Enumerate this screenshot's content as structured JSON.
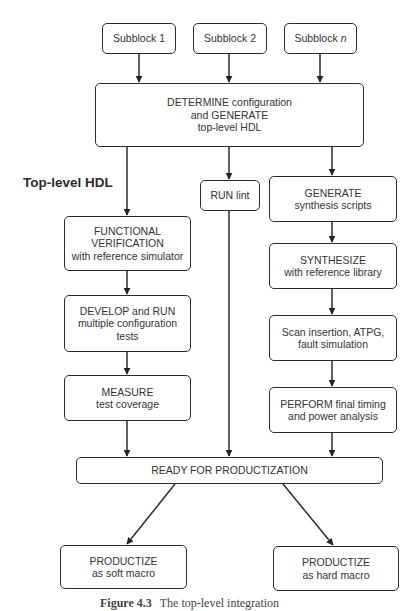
{
  "diagram": {
    "side_label": "Top-level HDL",
    "caption": {
      "figure": "Figure 4.3",
      "text": "The top-level integration"
    },
    "nodes": {
      "subblock1": {
        "lines": [
          "Subblock 1"
        ]
      },
      "subblock2": {
        "lines": [
          "Subblock 2"
        ]
      },
      "subblockn": {
        "prefix": "Subblock ",
        "italic": "n"
      },
      "determine": {
        "lines": [
          "DETERMINE configuration",
          "and GENERATE",
          "top-level HDL"
        ]
      },
      "runlint": {
        "lines": [
          "RUN lint"
        ]
      },
      "generate": {
        "lines": [
          "GENERATE",
          "synthesis scripts"
        ]
      },
      "functional": {
        "lines": [
          "FUNCTIONAL",
          "VERIFICATION",
          "with reference simulator"
        ]
      },
      "synthesize": {
        "lines": [
          "SYNTHESIZE",
          "with reference library"
        ]
      },
      "develop": {
        "lines": [
          "DEVELOP and RUN",
          "multiple configuration",
          "tests"
        ]
      },
      "scan": {
        "lines": [
          "Scan insertion, ATPG,",
          "fault simulation"
        ]
      },
      "measure": {
        "lines": [
          "MEASURE",
          "test coverage"
        ]
      },
      "perform": {
        "lines": [
          "PERFORM final timing",
          "and power analysis"
        ]
      },
      "ready": {
        "lines": [
          "READY FOR PRODUCTIZATION"
        ]
      },
      "soft": {
        "lines": [
          "PRODUCTIZE",
          "as soft macro"
        ]
      },
      "hard": {
        "lines": [
          "PRODUCTIZE",
          "as hard macro"
        ]
      }
    },
    "edges": [
      {
        "from": "subblock1",
        "to": "determine"
      },
      {
        "from": "subblock2",
        "to": "determine"
      },
      {
        "from": "subblockn",
        "to": "determine"
      },
      {
        "from": "determine",
        "to": "functional"
      },
      {
        "from": "determine",
        "to": "runlint"
      },
      {
        "from": "determine",
        "to": "generate"
      },
      {
        "from": "functional",
        "to": "develop"
      },
      {
        "from": "develop",
        "to": "measure"
      },
      {
        "from": "measure",
        "to": "ready"
      },
      {
        "from": "runlint",
        "to": "ready"
      },
      {
        "from": "generate",
        "to": "synthesize"
      },
      {
        "from": "synthesize",
        "to": "scan"
      },
      {
        "from": "scan",
        "to": "perform"
      },
      {
        "from": "perform",
        "to": "ready"
      },
      {
        "from": "ready",
        "to": "soft"
      },
      {
        "from": "ready",
        "to": "hard"
      }
    ],
    "colors": {
      "stroke": "#2b2b2b",
      "text": "#333333",
      "background": "#ffffff"
    }
  }
}
